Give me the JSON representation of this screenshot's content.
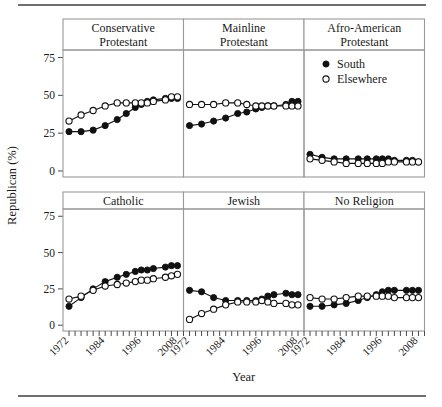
{
  "figure": {
    "ylabel": "Republican (%)",
    "xlabel": "Year",
    "y_ticks": [
      "0",
      "25",
      "50",
      "75"
    ],
    "x_ticks": [
      "1972",
      "1984",
      "1996",
      "2008"
    ],
    "top_rule_color": "#6f6f6f",
    "bottom_rule_color": "#6f6f6f",
    "frame_color": "#9a9a9a",
    "line_color": "#111111"
  },
  "legend": {
    "position": "top-right-panel",
    "entries": [
      {
        "label": "South",
        "marker": "filled-circle",
        "color": "#111111"
      },
      {
        "label": "Elsewhere",
        "marker": "open-circle",
        "color": "#ffffff"
      }
    ]
  },
  "chart_data": {
    "type": "line",
    "title": "",
    "xlabel": "Year",
    "ylabel": "Republican (%)",
    "xlim": [
      1970,
      2010
    ],
    "ylim": [
      -4,
      80
    ],
    "grid": false,
    "legend_entries": [
      "South",
      "Elsewhere"
    ],
    "facet_layout": {
      "rows": 2,
      "cols": 3
    },
    "panels": [
      {
        "name": "Conservative Protestant",
        "strip_lines": [
          "Conservative",
          "Protestant"
        ],
        "row": 0,
        "col": 0,
        "series": [
          {
            "name": "South",
            "marker": "filled-circle",
            "x": [
              1972,
              1976,
              1980,
              1984,
              1988,
              1991,
              1994,
              1996,
              1998,
              2000,
              2004,
              2006,
              2008
            ],
            "values": [
              26,
              26,
              27,
              30,
              34,
              38,
              42,
              44,
              46,
              47,
              48,
              48,
              48
            ]
          },
          {
            "name": "Elsewhere",
            "marker": "open-circle",
            "x": [
              1972,
              1976,
              1980,
              1984,
              1988,
              1991,
              1994,
              1996,
              1998,
              2000,
              2004,
              2006,
              2008
            ],
            "values": [
              33,
              37,
              40,
              43,
              45,
              45,
              45,
              45,
              45,
              46,
              47,
              49,
              49
            ]
          }
        ]
      },
      {
        "name": "Mainline Protestant",
        "strip_lines": [
          "Mainline",
          "Protestant"
        ],
        "row": 0,
        "col": 1,
        "series": [
          {
            "name": "South",
            "marker": "filled-circle",
            "x": [
              1972,
              1976,
              1980,
              1984,
              1988,
              1991,
              1994,
              1996,
              1998,
              2000,
              2004,
              2006,
              2008
            ],
            "values": [
              30,
              31,
              33,
              35,
              38,
              39,
              41,
              42,
              43,
              43,
              44,
              46,
              46
            ]
          },
          {
            "name": "Elsewhere",
            "marker": "open-circle",
            "x": [
              1972,
              1976,
              1980,
              1984,
              1988,
              1991,
              1994,
              1996,
              1998,
              2000,
              2004,
              2006,
              2008
            ],
            "values": [
              44,
              44,
              44,
              45,
              45,
              44,
              43,
              43,
              43,
              43,
              43,
              43,
              43
            ]
          }
        ]
      },
      {
        "name": "Afro-American Protestant",
        "strip_lines": [
          "Afro-American",
          "Protestant"
        ],
        "row": 0,
        "col": 2,
        "series": [
          {
            "name": "South",
            "marker": "filled-circle",
            "x": [
              1972,
              1976,
              1980,
              1984,
              1988,
              1991,
              1994,
              1996,
              1998,
              2000,
              2004,
              2006,
              2008
            ],
            "values": [
              11,
              9,
              8,
              8,
              8,
              8,
              8,
              8,
              8,
              7,
              7,
              7,
              6
            ]
          },
          {
            "name": "Elsewhere",
            "marker": "open-circle",
            "x": [
              1972,
              1976,
              1980,
              1984,
              1988,
              1991,
              1994,
              1996,
              1998,
              2000,
              2004,
              2006,
              2008
            ],
            "values": [
              8,
              7,
              6,
              5,
              5,
              5,
              5,
              5,
              6,
              6,
              6,
              6,
              6
            ]
          }
        ]
      },
      {
        "name": "Catholic",
        "strip_lines": [
          "Catholic"
        ],
        "row": 1,
        "col": 0,
        "series": [
          {
            "name": "South",
            "marker": "filled-circle",
            "x": [
              1972,
              1976,
              1980,
              1984,
              1988,
              1991,
              1994,
              1996,
              1998,
              2000,
              2004,
              2006,
              2008
            ],
            "values": [
              13,
              19,
              25,
              30,
              33,
              35,
              37,
              38,
              38,
              39,
              40,
              41,
              41
            ]
          },
          {
            "name": "Elsewhere",
            "marker": "open-circle",
            "x": [
              1972,
              1976,
              1980,
              1984,
              1988,
              1991,
              1994,
              1996,
              1998,
              2000,
              2004,
              2006,
              2008
            ],
            "values": [
              18,
              20,
              24,
              27,
              28,
              29,
              30,
              31,
              31,
              32,
              33,
              34,
              35
            ]
          }
        ]
      },
      {
        "name": "Jewish",
        "strip_lines": [
          "Jewish"
        ],
        "row": 1,
        "col": 1,
        "series": [
          {
            "name": "South",
            "marker": "filled-circle",
            "x": [
              1972,
              1976,
              1980,
              1984,
              1988,
              1991,
              1994,
              1996,
              1998,
              2000,
              2004,
              2006,
              2008
            ],
            "values": [
              24,
              23,
              19,
              17,
              17,
              17,
              17,
              18,
              20,
              21,
              22,
              21,
              21
            ]
          },
          {
            "name": "Elsewhere",
            "marker": "open-circle",
            "x": [
              1972,
              1976,
              1980,
              1984,
              1988,
              1991,
              1994,
              1996,
              1998,
              2000,
              2004,
              2006,
              2008
            ],
            "values": [
              4,
              8,
              11,
              14,
              16,
              16,
              16,
              17,
              16,
              15,
              15,
              14,
              14
            ]
          }
        ]
      },
      {
        "name": "No Religion",
        "strip_lines": [
          "No Religion"
        ],
        "row": 1,
        "col": 2,
        "series": [
          {
            "name": "South",
            "marker": "filled-circle",
            "x": [
              1972,
              1976,
              1980,
              1984,
              1988,
              1991,
              1994,
              1996,
              1998,
              2000,
              2004,
              2006,
              2008
            ],
            "values": [
              13,
              13,
              14,
              15,
              17,
              19,
              21,
              23,
              24,
              24,
              24,
              24,
              24
            ]
          },
          {
            "name": "Elsewhere",
            "marker": "open-circle",
            "x": [
              1972,
              1976,
              1980,
              1984,
              1988,
              1991,
              1994,
              1996,
              1998,
              2000,
              2004,
              2006,
              2008
            ],
            "values": [
              19,
              18,
              18,
              19,
              20,
              20,
              20,
              20,
              20,
              19,
              19,
              19,
              19
            ]
          }
        ]
      }
    ]
  }
}
